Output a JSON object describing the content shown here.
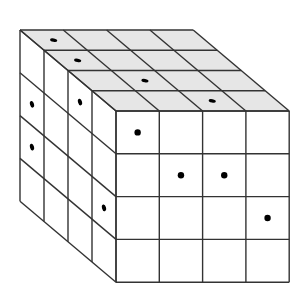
{
  "diagram": {
    "type": "isometric-cube-grid",
    "grid_size": {
      "width": 4,
      "height": 4,
      "depth": 4
    },
    "colors": {
      "background": "#ffffff",
      "top_face_fill": "#e6e6e6",
      "front_face_fill": "#ffffff",
      "side_face_fill": "#ffffff",
      "line": "#333333",
      "dot": "#000000"
    },
    "geometry": {
      "front_top_left": [
        116,
        111
      ],
      "cell_w": 43.3,
      "cell_h": 42.8,
      "depth_dx": 24,
      "depth_dy": 20.25
    },
    "dots": {
      "front": [
        {
          "col": 0,
          "row": 0
        },
        {
          "col": 1,
          "row": 1
        },
        {
          "col": 2,
          "row": 1
        },
        {
          "col": 3,
          "row": 2
        }
      ],
      "left": [
        {
          "depth": 1,
          "row": 0
        },
        {
          "depth": 3,
          "row": 1
        },
        {
          "depth": 3,
          "row": 2
        },
        {
          "depth": 0,
          "row": 2
        }
      ],
      "top": [
        {
          "col": 0,
          "depth": 2
        },
        {
          "col": 1,
          "depth": 1
        },
        {
          "col": 2,
          "depth": 0
        },
        {
          "col": 0,
          "depth": 3
        }
      ]
    }
  }
}
